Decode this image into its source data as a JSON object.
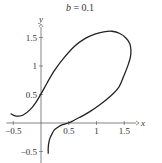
{
  "chart_data": {
    "type": "line",
    "title": "b = 0.1",
    "title_parts": {
      "var": "b",
      "eq": " = 0.1"
    },
    "xlabel": "x",
    "ylabel": "y",
    "xlim": [
      -0.55,
      1.75
    ],
    "ylim": [
      -0.6,
      1.75
    ],
    "grid": false,
    "legend": null,
    "x_ticks": [
      -0.5,
      0.5,
      1,
      1.5
    ],
    "x_tick_labels": [
      "−0.5",
      "0.5",
      "1",
      "1.5"
    ],
    "y_ticks": [
      -0.5,
      0.5,
      1,
      1.5
    ],
    "y_tick_labels": [
      "−0.5",
      "0.5",
      "1",
      "1.5"
    ],
    "series": [
      {
        "name": "curve",
        "color": "#222222",
        "points": [
          [
            -0.54,
            0.16
          ],
          [
            -0.48,
            0.13
          ],
          [
            -0.41,
            0.12
          ],
          [
            -0.32,
            0.14
          ],
          [
            -0.2,
            0.23
          ],
          [
            -0.1,
            0.35
          ],
          [
            0.0,
            0.51
          ],
          [
            0.12,
            0.72
          ],
          [
            0.25,
            0.93
          ],
          [
            0.42,
            1.15
          ],
          [
            0.61,
            1.35
          ],
          [
            0.79,
            1.48
          ],
          [
            0.97,
            1.56
          ],
          [
            1.13,
            1.6
          ],
          [
            1.28,
            1.61
          ],
          [
            1.42,
            1.57
          ],
          [
            1.53,
            1.49
          ],
          [
            1.6,
            1.39
          ],
          [
            1.62,
            1.28
          ],
          [
            1.61,
            1.15
          ],
          [
            1.57,
            1.02
          ],
          [
            1.49,
            0.82
          ],
          [
            1.39,
            0.61
          ],
          [
            1.24,
            0.46
          ],
          [
            1.06,
            0.32
          ],
          [
            0.88,
            0.2
          ],
          [
            0.7,
            0.1
          ],
          [
            0.58,
            0.04
          ],
          [
            0.49,
            0.0
          ],
          [
            0.39,
            -0.03
          ],
          [
            0.31,
            -0.07
          ],
          [
            0.24,
            -0.12
          ],
          [
            0.2,
            -0.19
          ],
          [
            0.16,
            -0.27
          ],
          [
            0.14,
            -0.35
          ],
          [
            0.13,
            -0.44
          ],
          [
            0.13,
            -0.53
          ]
        ]
      }
    ]
  }
}
